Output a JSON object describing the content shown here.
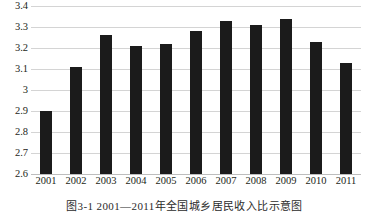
{
  "chart_data": {
    "type": "bar",
    "title": "",
    "xlabel": "",
    "ylabel": "",
    "categories": [
      "2001",
      "2002",
      "2003",
      "2004",
      "2005",
      "2006",
      "2007",
      "2008",
      "2009",
      "2010",
      "2011"
    ],
    "values": [
      2.9,
      3.11,
      3.26,
      3.21,
      3.22,
      3.28,
      3.33,
      3.31,
      3.34,
      3.23,
      3.13
    ],
    "ylim": [
      2.6,
      3.4
    ],
    "ytick_labels": [
      "3.4",
      "3.3",
      "3.2",
      "3.1",
      "3",
      "2.9",
      "2.8",
      "2.7",
      "2.6"
    ],
    "ytick_values": [
      3.4,
      3.3,
      3.2,
      3.1,
      3.0,
      2.9,
      2.8,
      2.7,
      2.6
    ],
    "grid": true,
    "legend": "none",
    "bar_color": "#1b1b1b",
    "gridline_color": "#d4d4d4"
  },
  "caption": {
    "text": "图3-1  2001—2011年全国城乡居民收入比示意图"
  }
}
